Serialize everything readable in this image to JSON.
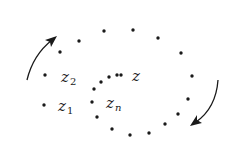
{
  "diagram": {
    "labels": {
      "z": "z",
      "z1_base": "z",
      "z1_sub": "1",
      "z2_base": "z",
      "z2_sub": "2",
      "zn_base": "z",
      "zn_sub": "n"
    },
    "points": [
      [
        45,
        75
      ],
      [
        44,
        105
      ],
      [
        60,
        52
      ],
      [
        79,
        41
      ],
      [
        104,
        31
      ],
      [
        133,
        30
      ],
      [
        158,
        38
      ],
      [
        181,
        53
      ],
      [
        192,
        76
      ],
      [
        188,
        99
      ],
      [
        178,
        114
      ],
      [
        165,
        124
      ],
      [
        149,
        133
      ],
      [
        130,
        135
      ],
      [
        112,
        129
      ],
      [
        97,
        117
      ],
      [
        92,
        102
      ],
      [
        94,
        89
      ],
      [
        101,
        82
      ],
      [
        109,
        77
      ],
      [
        117,
        75
      ],
      [
        121,
        75
      ]
    ],
    "arrows": [
      {
        "name": "counterclockwise-arrow-left",
        "direction": "up"
      },
      {
        "name": "clockwise-arrow-right",
        "direction": "down"
      }
    ],
    "colors": {
      "ink": "#1a1a1a",
      "background": "#ffffff"
    }
  }
}
